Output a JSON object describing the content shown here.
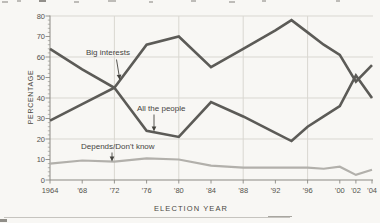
{
  "annotations": [
    {
      "label": "Big interests",
      "points_to": "rising dark line near 1972 crossing"
    },
    {
      "label": "All the people",
      "points_to": "falling dark line near 1976"
    },
    {
      "label": "Depends/Don't know",
      "points_to": "flat light line near 1972"
    }
  ],
  "colors": {
    "background": "#f8f7f4",
    "dark_series": "#5c5b57",
    "light_series": "#b2b0ab",
    "gridline": "#d9d7d1",
    "axis": "#8b8983",
    "text": "#4a4842"
  },
  "chart_data": {
    "type": "line",
    "title": "",
    "xlabel": "ELECTION YEAR",
    "ylabel": "PERCENTAGE",
    "ylim": [
      0,
      80
    ],
    "xlim": [
      1964,
      2004
    ],
    "grid": "horizontal at 20/40/60/80, vertical at 1972/1980/1988/1996",
    "legend_position": "inline annotations with arrows",
    "y_ticks": [
      0,
      10,
      20,
      30,
      40,
      50,
      60,
      70,
      80
    ],
    "y_minor_tick_step": 2,
    "grid_horizontal_values": [
      20,
      40,
      60,
      80
    ],
    "grid_vertical_years": [
      1972,
      1980,
      1988,
      1996
    ],
    "x_tick_years": [
      1964,
      1968,
      1972,
      1976,
      1980,
      1984,
      1988,
      1992,
      1996,
      2000,
      2002,
      2004
    ],
    "x_tick_texts": [
      "1964",
      "’68",
      "’72",
      "’76",
      "’80",
      "’84",
      "’88",
      "’92",
      "’96",
      "’00",
      "’02",
      "’04"
    ],
    "x": [
      1964,
      1968,
      1972,
      1976,
      1980,
      1984,
      1988,
      1992,
      1994,
      1996,
      1998,
      2000,
      2002,
      2004
    ],
    "series": [
      {
        "name": "Big interests",
        "color": "#5c5b57",
        "width": 2.6,
        "values": [
          29,
          37,
          45,
          66,
          70,
          55,
          64,
          73,
          78,
          72,
          66,
          61,
          48,
          56
        ]
      },
      {
        "name": "All the people",
        "color": "#5c5b57",
        "width": 2.6,
        "values": [
          64,
          54,
          45,
          24,
          21,
          38,
          31,
          23,
          19,
          26,
          31,
          36,
          51,
          40
        ]
      },
      {
        "name": "Depends/Don't know",
        "color": "#b2b0ab",
        "width": 2.2,
        "values": [
          8,
          9.5,
          9,
          10.5,
          10,
          7,
          6,
          6,
          6,
          6,
          5.5,
          6.5,
          2.5,
          5
        ]
      }
    ]
  }
}
